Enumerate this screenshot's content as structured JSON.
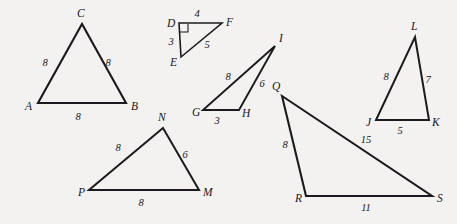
{
  "figure": {
    "background_color": "#f3f2f0",
    "stroke_color": "#1b1b1f",
    "label_color": "#17171b",
    "width": 457,
    "height": 224,
    "triangles": [
      {
        "id": "ABC",
        "name": "triangle-abc",
        "stroke_width": 2.1,
        "vertices": [
          {
            "label": "A",
            "x": 38,
            "y": 103,
            "label_x": 25,
            "label_y": 110
          },
          {
            "label": "B",
            "x": 126,
            "y": 103,
            "label_x": 131,
            "label_y": 110
          },
          {
            "label": "C",
            "x": 82,
            "y": 24,
            "label_x": 77,
            "label_y": 17
          }
        ],
        "sides": [
          {
            "label": "8",
            "x": 45,
            "y": 66
          },
          {
            "label": "8",
            "x": 108,
            "y": 66
          },
          {
            "label": "8",
            "x": 78,
            "y": 120
          }
        ],
        "right_angle": null
      },
      {
        "id": "DEF",
        "name": "triangle-def",
        "stroke_width": 1.6,
        "vertices": [
          {
            "label": "D",
            "x": 179,
            "y": 23,
            "label_x": 167,
            "label_y": 27
          },
          {
            "label": "E",
            "x": 181,
            "y": 57,
            "label_x": 170,
            "label_y": 66
          },
          {
            "label": "F",
            "x": 222,
            "y": 23,
            "label_x": 226,
            "label_y": 26
          }
        ],
        "sides": [
          {
            "label": "4",
            "x": 197,
            "y": 17
          },
          {
            "label": "3",
            "x": 171,
            "y": 45
          },
          {
            "label": "5",
            "x": 207,
            "y": 48
          }
        ],
        "right_angle": {
          "x": 180,
          "y": 24,
          "size": 8
        }
      },
      {
        "id": "GHI",
        "name": "triangle-ghi",
        "stroke_width": 1.9,
        "vertices": [
          {
            "label": "G",
            "x": 203,
            "y": 110,
            "label_x": 192,
            "label_y": 116
          },
          {
            "label": "H",
            "x": 239,
            "y": 110,
            "label_x": 242,
            "label_y": 117
          },
          {
            "label": "I",
            "x": 275,
            "y": 46,
            "label_x": 279,
            "label_y": 42
          }
        ],
        "sides": [
          {
            "label": "8",
            "x": 228,
            "y": 80
          },
          {
            "label": "6",
            "x": 262,
            "y": 87
          },
          {
            "label": "3",
            "x": 217,
            "y": 124
          }
        ],
        "right_angle": null
      },
      {
        "id": "PNM",
        "name": "triangle-pnm",
        "stroke_width": 2.0,
        "vertices": [
          {
            "label": "P",
            "x": 89,
            "y": 190,
            "label_x": 78,
            "label_y": 196
          },
          {
            "label": "M",
            "x": 199,
            "y": 190,
            "label_x": 203,
            "label_y": 196
          },
          {
            "label": "N",
            "x": 163,
            "y": 128,
            "label_x": 158,
            "label_y": 121
          }
        ],
        "sides": [
          {
            "label": "8",
            "x": 118,
            "y": 151
          },
          {
            "label": "6",
            "x": 185,
            "y": 158
          },
          {
            "label": "8",
            "x": 141,
            "y": 206
          }
        ],
        "right_angle": null
      },
      {
        "id": "QRS",
        "name": "triangle-qrs",
        "stroke_width": 2.1,
        "vertices": [
          {
            "label": "Q",
            "x": 282,
            "y": 96,
            "label_x": 272,
            "label_y": 90
          },
          {
            "label": "R",
            "x": 306,
            "y": 196,
            "label_x": 295,
            "label_y": 202
          },
          {
            "label": "S",
            "x": 432,
            "y": 196,
            "label_x": 437,
            "label_y": 202
          }
        ],
        "sides": [
          {
            "label": "8",
            "x": 285,
            "y": 148
          },
          {
            "label": "15",
            "x": 366,
            "y": 143
          },
          {
            "label": "11",
            "x": 366,
            "y": 211
          }
        ],
        "right_angle": null
      },
      {
        "id": "JKL",
        "name": "triangle-jkl",
        "stroke_width": 2.0,
        "vertices": [
          {
            "label": "J",
            "x": 376,
            "y": 120,
            "label_x": 366,
            "label_y": 126
          },
          {
            "label": "K",
            "x": 429,
            "y": 120,
            "label_x": 432,
            "label_y": 126
          },
          {
            "label": "L",
            "x": 415,
            "y": 37,
            "label_x": 411,
            "label_y": 30
          }
        ],
        "sides": [
          {
            "label": "8",
            "x": 386,
            "y": 80
          },
          {
            "label": "7",
            "x": 428,
            "y": 83
          },
          {
            "label": "5",
            "x": 400,
            "y": 134
          }
        ],
        "right_angle": null
      }
    ]
  }
}
